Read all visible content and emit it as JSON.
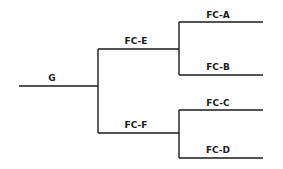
{
  "diagram": {
    "type": "bracket-tree",
    "root": {
      "label": "G",
      "line": {
        "x1": 19,
        "x2": 98,
        "y": 86
      },
      "label_pos": {
        "x": 52,
        "y": 81
      }
    },
    "level1": [
      {
        "label": "FC-E",
        "line": {
          "x1": 98,
          "x2": 179,
          "y": 49
        },
        "label_pos": {
          "x": 136,
          "y": 44
        }
      },
      {
        "label": "FC-F",
        "line": {
          "x1": 98,
          "x2": 179,
          "y": 133
        },
        "label_pos": {
          "x": 136,
          "y": 128
        }
      }
    ],
    "level2": [
      {
        "label": "FC-A",
        "parent": "FC-E",
        "line": {
          "x1": 179,
          "x2": 263,
          "y": 22
        },
        "label_pos": {
          "x": 218,
          "y": 18
        }
      },
      {
        "label": "FC-B",
        "parent": "FC-E",
        "line": {
          "x1": 179,
          "x2": 263,
          "y": 75
        },
        "label_pos": {
          "x": 218,
          "y": 70
        }
      },
      {
        "label": "FC-C",
        "parent": "FC-F",
        "line": {
          "x1": 179,
          "x2": 263,
          "y": 110
        },
        "label_pos": {
          "x": 218,
          "y": 106
        }
      },
      {
        "label": "FC-D",
        "parent": "FC-F",
        "line": {
          "x1": 179,
          "x2": 263,
          "y": 158
        },
        "label_pos": {
          "x": 218,
          "y": 153
        }
      }
    ],
    "line_color": "#1a1a1a"
  }
}
